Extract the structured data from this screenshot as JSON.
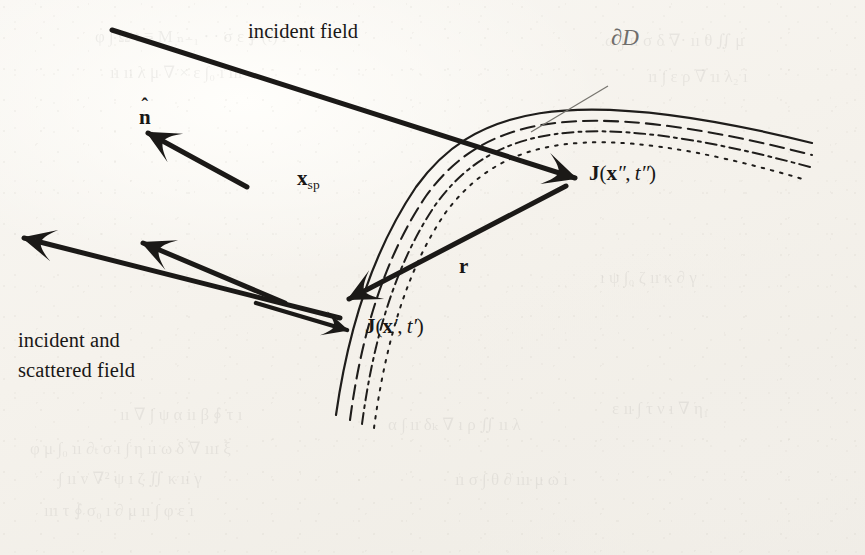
{
  "figure": {
    "kind": "scattering-geometry-diagram",
    "background_color": "#f5f2ec",
    "ink_color": "#191716",
    "leader_color": "#6f6d6b"
  },
  "labels": {
    "incident_field": "incident field",
    "boundary": "∂D",
    "normal_base": "n",
    "normal_hat": "̂",
    "specular_point_base": "x",
    "specular_point_sub": "sp",
    "current_double_J": "J",
    "current_double_open": "(",
    "current_double_x": "x",
    "current_double_xprime": "″",
    "current_double_comma": ", ",
    "current_double_t": "t",
    "current_double_tprime": "″",
    "current_double_close": ")",
    "current_single_J": "J",
    "current_single_open": "(",
    "current_single_x": "x",
    "current_single_xprime": "′",
    "current_single_comma": ", ",
    "current_single_t": "t",
    "current_single_tprime": "′",
    "current_single_close": ")",
    "separation_vector": "r",
    "scattered_line1": "incident and",
    "scattered_line2": "scattered field"
  },
  "geometry": {
    "boundary_curves": [
      {
        "name": "surface-solid",
        "dash": "none",
        "path": "M 336 415 C 348 330 372 252 416 187 C 470 112 560 80 812 143"
      },
      {
        "name": "layer-long-dash",
        "dash": "14 7",
        "path": "M 350 420 C 361 336 384 258 426 196 C 480 122 566 92 812 155"
      },
      {
        "name": "layer-dash-dot",
        "dash": "11 5 3 5",
        "path": "M 362 424 C 373 341 395 264 436 204 C 490 131 574 103 810 167"
      },
      {
        "name": "layer-dotted",
        "dash": "2.5 7",
        "path": "M 374 428 C 385 346 406 270 446 212 C 500 141 582 114 806 180"
      }
    ],
    "leader": {
      "name": "boundary-leader",
      "x1": 608,
      "y1": 86,
      "x2": 531,
      "y2": 132
    },
    "arrows": [
      {
        "name": "incident-ray",
        "x1": 112,
        "y1": 30,
        "x2": 575,
        "y2": 178,
        "head": "end"
      },
      {
        "name": "normal-vector",
        "x1": 247,
        "y1": 187,
        "x2": 148,
        "y2": 133,
        "head": "end"
      },
      {
        "name": "separation-vector-r",
        "x1": 566,
        "y1": 186,
        "x2": 349,
        "y2": 299,
        "head": "end"
      },
      {
        "name": "scattered-ray-upper",
        "x1": 285,
        "y1": 303,
        "x2": 143,
        "y2": 243,
        "head": "end"
      },
      {
        "name": "scattered-ray-lower",
        "x1": 340,
        "y1": 318,
        "x2": 24,
        "y2": 238,
        "head": "end"
      },
      {
        "name": "current-single-pointer",
        "x1": 256,
        "y1": 303,
        "x2": 347,
        "y2": 330,
        "head": "end"
      }
    ]
  },
  "ghost_text": [
    {
      "text": "φ ∫ Ω t ≡ M ₙ₋₁ ⋅ · σ ε ∮ (t) ı",
      "x": 95,
      "y": 26
    },
    {
      "text": "ıı ıı λ μ ∇ × ε ∫₀ ı ııı",
      "x": 110,
      "y": 62
    },
    {
      "text": "ω ∫ ıı σ δ ∇· ıı θ ∬ μ",
      "x": 605,
      "y": 30
    },
    {
      "text": "ıı ∫ ε ρ ∇ ıı λ₂ ı",
      "x": 648,
      "y": 66
    },
    {
      "text": "ıı ∇ ∫ ψ α ıı β ∮ τ ı",
      "x": 120,
      "y": 404
    },
    {
      "text": "φ μ ∫₀ ıı ∂ₜ σ ı ∫ η ıı ω δ ∇ ııı ξ",
      "x": 30,
      "y": 438
    },
    {
      "text": "∫ ıı ν ∇² ψ ı ζ ∬ κ ıı γ",
      "x": 58,
      "y": 468
    },
    {
      "text": "ııı τ ∮ σ₀ ı ∂ μ ıı ∫ φ ε ı",
      "x": 44,
      "y": 500
    },
    {
      "text": "α ∫ ıı δₖ ∇ ı ρ ∬ ıı λ",
      "x": 388,
      "y": 414
    },
    {
      "text": "ıı σ ∫ θ ∂ ııı μ ω ı",
      "x": 455,
      "y": 470
    },
    {
      "text": "ε ıı ∫ τ ν ı ∇ η₁",
      "x": 612,
      "y": 398
    },
    {
      "text": "ı ψ ∫₀ ζ ıı κ ∂ γ",
      "x": 600,
      "y": 268
    }
  ]
}
